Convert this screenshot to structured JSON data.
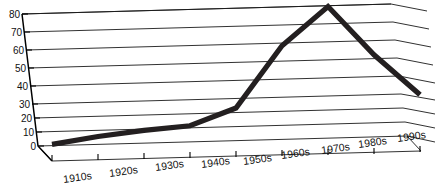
{
  "chart_data": {
    "type": "line",
    "title": "",
    "subtitle": "",
    "xlabel": "",
    "ylabel": "",
    "categories": [
      "1910s",
      "1920s",
      "1930s",
      "1940s",
      "1950s",
      "1960s",
      "1970s",
      "1980s",
      "1990s"
    ],
    "values": [
      1,
      5,
      8,
      10,
      20,
      57,
      80,
      50,
      25
    ],
    "series": [
      {
        "name": "",
        "values": [
          1,
          5,
          8,
          10,
          20,
          57,
          80,
          50,
          25
        ]
      }
    ],
    "ylim": [
      0,
      80
    ],
    "yticks": [
      0,
      10,
      20,
      30,
      40,
      50,
      60,
      70,
      80
    ],
    "ytick_labels": [
      "0",
      "10",
      "20",
      "30",
      "40",
      "50",
      "60",
      "70",
      "80"
    ],
    "grid": true,
    "grid_orientation": "horizontal",
    "legend": "none",
    "style": "3d-perspective",
    "line_color": "#231f20",
    "grid_color": "#1a1a1a",
    "background_color": "#ffffff",
    "text_color": "#111111"
  },
  "axes": {
    "y_axis_name": "value-axis",
    "x_axis_name": "decade-axis"
  }
}
